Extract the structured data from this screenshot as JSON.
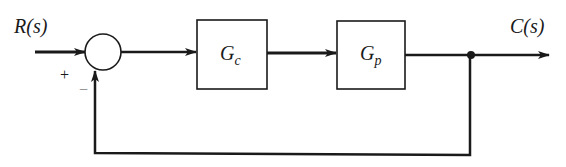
{
  "diagram": {
    "type": "feedback-control-block-diagram",
    "input": {
      "label": "R(s)"
    },
    "output": {
      "label": "C(s)"
    },
    "summing_junction": {
      "plus_sign": "+",
      "minus_sign": "−"
    },
    "blocks": [
      {
        "id": "controller",
        "symbol": "G",
        "subscript": "c"
      },
      {
        "id": "plant",
        "symbol": "G",
        "subscript": "p"
      }
    ],
    "feedback": {
      "type": "unity",
      "sign": "negative"
    },
    "colors": {
      "line": "#1a1a1a",
      "background": "#ffffff"
    }
  }
}
